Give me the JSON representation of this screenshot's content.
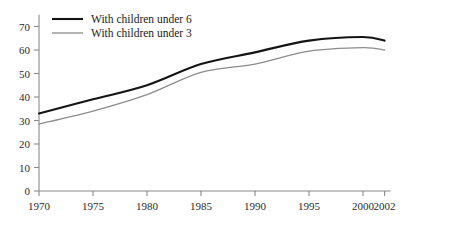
{
  "chart_data": {
    "type": "line",
    "title": "",
    "xlabel": "",
    "ylabel": "",
    "grid": false,
    "legend_position": "top-left",
    "x": [
      1970,
      1975,
      1980,
      1985,
      1990,
      1995,
      2000,
      2002
    ],
    "xtick_labels": [
      "1970",
      "1975",
      "1980",
      "1985",
      "1990",
      "1995",
      "2000",
      "2002"
    ],
    "ytick_labels": [
      "0",
      "10",
      "20",
      "30",
      "40",
      "50",
      "60",
      "70"
    ],
    "ytick_values": [
      0,
      10,
      20,
      30,
      40,
      50,
      60,
      70
    ],
    "xlim": [
      1970,
      2002
    ],
    "ylim": [
      0,
      75
    ],
    "series": [
      {
        "name": "With children under 6",
        "color": "#141414",
        "width": 2.1,
        "values": [
          33,
          39,
          45,
          54,
          59,
          64,
          65.5,
          64
        ]
      },
      {
        "name": "With children under 3",
        "color": "#8c8c8c",
        "width": 1.3,
        "values": [
          28.5,
          34,
          41,
          50.5,
          54,
          59.5,
          61,
          60
        ]
      }
    ]
  },
  "legend": {
    "items": [
      {
        "label": "With children under 6"
      },
      {
        "label": "With children under 3"
      }
    ]
  }
}
